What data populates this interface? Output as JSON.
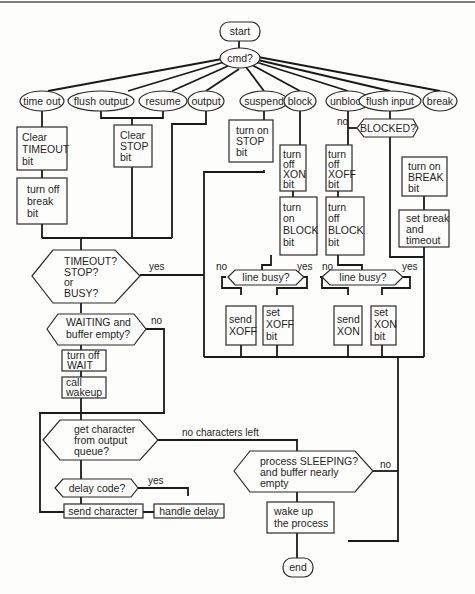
{
  "diagram": {
    "type": "flowchart",
    "terminals": {
      "start": "start",
      "end": "end"
    },
    "dispatch": "cmd?",
    "commands": [
      "time out",
      "flush output",
      "resume",
      "output",
      "suspend",
      "block",
      "unblock",
      "flush input",
      "break"
    ],
    "boxes": {
      "clear_timeout": [
        "Clear",
        "TIMEOUT",
        "bit"
      ],
      "turn_off_break": [
        "turn off",
        "break",
        "bit"
      ],
      "clear_stop": [
        "Clear",
        "STOP",
        "bit"
      ],
      "turn_on_stop": [
        "turn on",
        "STOP",
        "bit"
      ],
      "turn_off_xon": [
        "turn",
        "off",
        "XON",
        "bit"
      ],
      "turn_on_block": [
        "turn",
        "on",
        "BLOCK",
        "bit"
      ],
      "turn_off_xoff": [
        "turn",
        "off",
        "XOFF",
        "bit"
      ],
      "turn_off_block": [
        "turn",
        "off",
        "BLOCK",
        "bit"
      ],
      "turn_on_break": [
        "turn on",
        "BREAK",
        "bit"
      ],
      "set_break_timeout": [
        "set break",
        "and",
        "timeout"
      ],
      "send_xoff": [
        "send",
        "XOFF"
      ],
      "set_xoff_bit": [
        "set",
        "XOFF",
        "bit"
      ],
      "send_xon": [
        "send",
        "XON"
      ],
      "set_xon_bit": [
        "set",
        "XON",
        "bit"
      ],
      "turn_off_wait": [
        "turn off",
        "WAIT"
      ],
      "call_wakeup": [
        "call",
        "wakeup"
      ],
      "send_character": [
        "send character"
      ],
      "handle_delay": [
        "handle delay"
      ],
      "wake_up_process": [
        "wake up",
        "the process"
      ]
    },
    "decisions": {
      "blocked": [
        "BLOCKED?"
      ],
      "timeout_stop_busy": [
        "TIMEOUT?",
        "STOP?",
        "or",
        "BUSY?"
      ],
      "line_busy_1": [
        "line busy?"
      ],
      "line_busy_2": [
        "line busy?"
      ],
      "waiting_buffer_empty": [
        "WAITING and",
        "buffer empty?"
      ],
      "get_character": [
        "get character",
        "from output",
        "queue?"
      ],
      "delay_code": [
        "delay code?"
      ],
      "process_sleeping": [
        "process SLEEPING?",
        "and buffer nearly",
        "empty"
      ]
    },
    "edge_labels": {
      "yes": "yes",
      "no": "no",
      "no_characters_left": "no characters left"
    },
    "colors": {
      "line": "#1a1a1a",
      "background": "#fdfdfb"
    }
  }
}
